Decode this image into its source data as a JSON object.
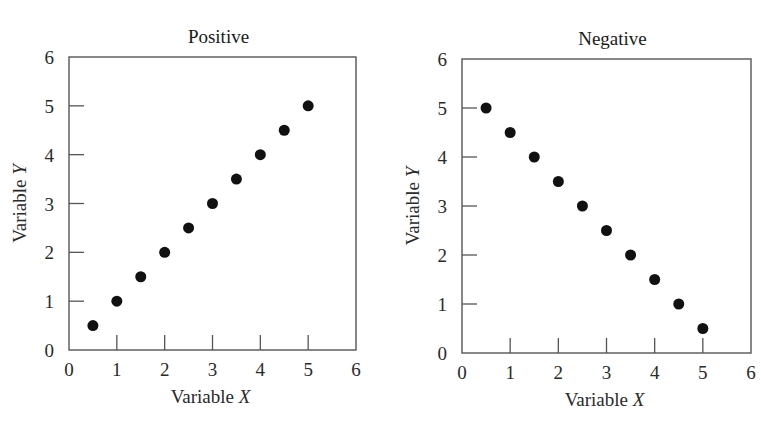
{
  "figure": {
    "cutoff_caption_visible": false
  },
  "chart_data": [
    {
      "type": "scatter",
      "title": "Positive",
      "xlabel": "Variable",
      "xlabel_italic": "X",
      "ylabel": "Variable",
      "ylabel_italic": "Y",
      "xlim": [
        0,
        6
      ],
      "ylim": [
        0,
        6
      ],
      "xticks": [
        0,
        1,
        2,
        3,
        4,
        5,
        6
      ],
      "yticks": [
        0,
        1,
        2,
        3,
        4,
        5,
        6
      ],
      "grid": false,
      "legend": null,
      "tick_direction": "in",
      "marker": {
        "shape": "circle",
        "color": "#111111",
        "size_px": 11
      },
      "x": [
        0.5,
        1.0,
        1.5,
        2.0,
        2.5,
        3.0,
        3.5,
        4.0,
        4.5,
        5.0
      ],
      "y": [
        0.5,
        1.0,
        1.5,
        2.0,
        2.5,
        3.0,
        3.5,
        4.0,
        4.5,
        5.0
      ],
      "layout": {
        "left": 69,
        "top": 57,
        "width": 287,
        "height": 293
      }
    },
    {
      "type": "scatter",
      "title": "Negative",
      "xlabel": "Variable",
      "xlabel_italic": "X",
      "ylabel": "Variable",
      "ylabel_italic": "Y",
      "xlim": [
        0,
        6
      ],
      "ylim": [
        0,
        6
      ],
      "xticks": [
        0,
        1,
        2,
        3,
        4,
        5,
        6
      ],
      "yticks": [
        0,
        1,
        2,
        3,
        4,
        5,
        6
      ],
      "grid": false,
      "legend": null,
      "tick_direction": "in",
      "marker": {
        "shape": "circle",
        "color": "#111111",
        "size_px": 11
      },
      "x": [
        0.5,
        1.0,
        1.5,
        2.0,
        2.5,
        3.0,
        3.5,
        4.0,
        4.5,
        5.0
      ],
      "y": [
        5.0,
        4.5,
        4.0,
        3.5,
        3.0,
        2.5,
        2.0,
        1.5,
        1.0,
        0.5
      ],
      "layout": {
        "left": 462,
        "top": 59,
        "width": 289,
        "height": 294
      }
    }
  ]
}
